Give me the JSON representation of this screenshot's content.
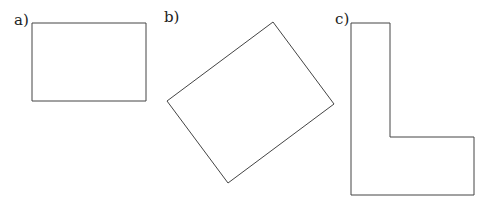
{
  "figure": {
    "panels": [
      {
        "label": "a)",
        "shape": "rectangle",
        "points": [
          [
            32,
            23
          ],
          [
            146,
            23
          ],
          [
            146,
            101
          ],
          [
            32,
            101
          ]
        ]
      },
      {
        "label": "b)",
        "shape": "rotated-rectangle",
        "points": [
          [
            273,
            22
          ],
          [
            334,
            104
          ],
          [
            228,
            183
          ],
          [
            167,
            101
          ]
        ]
      },
      {
        "label": "c)",
        "shape": "L-shape",
        "points": [
          [
            351,
            23
          ],
          [
            390,
            23
          ],
          [
            390,
            137
          ],
          [
            474,
            137
          ],
          [
            474,
            195
          ],
          [
            351,
            195
          ]
        ]
      }
    ],
    "stroke_color": "#444444"
  }
}
